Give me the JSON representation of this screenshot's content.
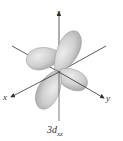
{
  "diagram": {
    "title": "3d",
    "subscript": "xz",
    "axes": {
      "x_label": "x",
      "y_label": "y",
      "z_label": "z"
    },
    "colors": {
      "lobe_fill": "#c9c9c9",
      "lobe_highlight": "#e8e8e8",
      "lobe_stroke": "#9a9a9a",
      "axis": "#333333"
    }
  }
}
